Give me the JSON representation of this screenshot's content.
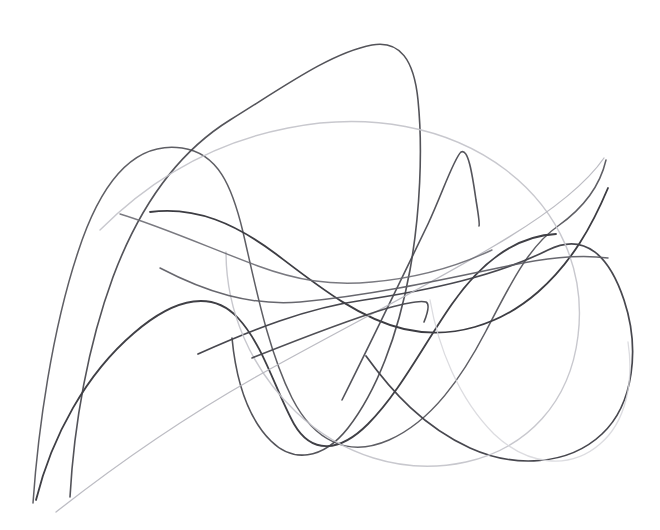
{
  "artwork": {
    "title": "Abstract Continuous Line Drawing",
    "medium": "graphite-line-scribble",
    "canvas": {
      "width": 660,
      "height": 530,
      "background_color": "#ffffff"
    },
    "palette": {
      "darkest": "#3a3a3e",
      "dark": "#4e4e54",
      "mid": "#6e6e76",
      "light": "#a3a3ab",
      "lightest": "#c9c9d0",
      "faintest": "#ddddE2"
    },
    "description": "Seven overlapping free-form smooth curves of varying graphite weight on a plain white field, forming loops, cusps and a large rounded lobe at right.",
    "strokes": [
      {
        "id": "stroke-1-tall-loop",
        "name": "tall-left-loop",
        "color": "#55555c",
        "width": 1.5,
        "opacity": 0.95,
        "path": "M 33 503 C 38 430 52 330 78 252 C 104 172 140 142 182 148 C 218 153 232 186 243 232 C 256 288 268 350 292 398 C 314 441 348 458 389 440 C 432 421 462 377 486 331 C 510 285 528 247 558 226 C 582 209 600 186 606 160"
      },
      {
        "id": "stroke-2-top-peak",
        "name": "tall-top-peak-curve",
        "color": "#4a4a50",
        "width": 1.6,
        "opacity": 0.95,
        "path": "M 70 497 C 74 424 88 345 113 277 C 140 205 180 151 230 120 C 282 88 330 53 372 45 C 400 40 414 60 418 100 C 423 150 420 214 410 270 C 398 336 376 392 348 428 C 322 461 292 462 271 441 C 248 418 236 380 232 338"
      },
      {
        "id": "stroke-3-dark-sweep",
        "name": "dark-central-sweep",
        "color": "#3c3c42",
        "width": 1.8,
        "opacity": 1.0,
        "path": "M 150 212 C 196 206 236 224 276 254 C 318 286 358 318 404 329 C 452 340 500 325 538 292 C 572 262 592 226 608 188"
      },
      {
        "id": "stroke-4-lower-arc",
        "name": "lower-dark-arc",
        "color": "#3f3f45",
        "width": 1.8,
        "opacity": 1.0,
        "path": "M 36 500 C 52 436 86 374 134 333 C 178 295 214 292 238 318 C 264 346 276 392 294 424 C 312 455 340 452 368 424 C 400 392 424 344 452 304 C 480 264 514 236 556 234"
      },
      {
        "id": "stroke-5-right-lobe",
        "name": "right-large-lobe",
        "color": "#43434a",
        "width": 1.7,
        "opacity": 0.98,
        "path": "M 198 354 C 252 330 306 308 364 300 C 430 290 496 276 548 250 C 586 231 610 258 624 300 C 640 348 634 404 602 434 C 568 466 514 468 470 448 C 424 427 392 392 366 356"
      },
      {
        "id": "stroke-6-faint-ellipse",
        "name": "faint-large-ellipse",
        "color": "#c2c2c9",
        "width": 1.4,
        "opacity": 0.9,
        "path": "M 100 230 C 152 178 216 142 288 128 C 368 112 448 126 506 170 C 560 211 586 272 578 336 C 570 402 528 448 466 462 C 402 476 340 454 296 412 C 250 368 226 310 226 252"
      },
      {
        "id": "stroke-7-cusp-spike",
        "name": "narrow-cusp-spike",
        "color": "#4b4b52",
        "width": 1.6,
        "opacity": 0.95,
        "path": "M 342 400 C 370 344 400 282 428 224 C 442 194 454 158 461 152 C 468 148 472 172 476 200 C 479 218 480 224 479 226"
      },
      {
        "id": "stroke-8-faint-diagonal",
        "name": "faint-rising-diagonal",
        "color": "#b5b5bd",
        "width": 1.3,
        "opacity": 0.9,
        "path": "M 56 512 C 112 468 180 420 254 378 C 336 332 420 290 494 246 C 552 212 586 184 604 158"
      },
      {
        "id": "stroke-9-hook",
        "name": "small-hook-corner",
        "color": "#46464c",
        "width": 1.6,
        "opacity": 0.95,
        "path": "M 252 358 C 292 342 342 322 388 308 C 406 303 420 300 426 302 C 430 304 428 312 424 322"
      },
      {
        "id": "stroke-10-faint-bottom",
        "name": "faint-bottom-lobe",
        "color": "#d6d6db",
        "width": 1.3,
        "opacity": 0.85,
        "path": "M 430 300 C 438 346 458 398 494 434 C 528 466 570 470 600 444 C 626 422 634 382 628 342"
      },
      {
        "id": "stroke-11-long-horizontal",
        "name": "long-horizontal-curve",
        "color": "#5a5a62",
        "width": 1.5,
        "opacity": 0.92,
        "path": "M 160 268 C 206 292 250 306 300 302 C 366 296 432 282 498 268 C 544 258 578 254 608 258"
      },
      {
        "id": "stroke-12-mid-dip",
        "name": "mid-shallow-dip",
        "color": "#6a6a72",
        "width": 1.4,
        "opacity": 0.9,
        "path": "M 120 214 C 160 226 210 248 258 266 C 296 280 330 286 372 282 C 418 278 458 266 492 250"
      }
    ]
  }
}
